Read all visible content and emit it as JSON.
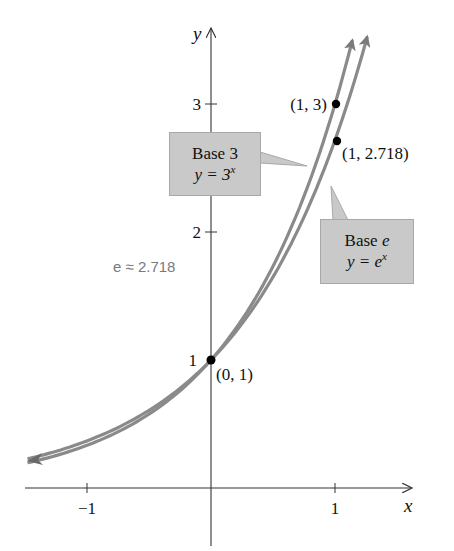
{
  "chart_data": {
    "type": "line",
    "title": "",
    "xlabel": "x",
    "ylabel": "y",
    "x_ticks": [
      -1,
      1
    ],
    "x_tick_labels": [
      "−1",
      "1"
    ],
    "y_ticks": [
      1,
      2,
      3
    ],
    "y_tick_labels": [
      "1",
      "2",
      "3"
    ],
    "xlim": [
      -1.5,
      1.6
    ],
    "ylim": [
      -0.45,
      3.6
    ],
    "grid": false,
    "series": [
      {
        "name": "Base 3",
        "equation": "y = 3^x",
        "base": 3,
        "x_range": [
          -1.48,
          1.14
        ],
        "color": "#8a8a8a",
        "sample_points": [
          [
            -1,
            0.333
          ],
          [
            0,
            1
          ],
          [
            0.5,
            1.732
          ],
          [
            1,
            3
          ]
        ]
      },
      {
        "name": "Base e",
        "equation": "y = e^x",
        "base": 2.718,
        "x_range": [
          -1.48,
          1.26
        ],
        "color": "#8a8a8a",
        "sample_points": [
          [
            -1,
            0.368
          ],
          [
            0,
            1
          ],
          [
            0.5,
            1.649
          ],
          [
            1,
            2.718
          ]
        ]
      }
    ],
    "annotations": [
      {
        "text": "(1, 3)",
        "x": 1,
        "y": 3
      },
      {
        "text": "(1, 2.718)",
        "x": 1,
        "y": 2.718
      },
      {
        "text": "(0, 1)",
        "x": 0,
        "y": 1
      },
      {
        "text": "e ≈ 2.718",
        "x": -0.8,
        "y": 1.75
      }
    ]
  },
  "axes": {
    "x_label": "x",
    "y_label": "y",
    "x_ticks": [
      {
        "label": "−1",
        "value": -1
      },
      {
        "label": "1",
        "value": 1
      }
    ],
    "y_ticks": [
      {
        "label": "1",
        "value": 1
      },
      {
        "label": "2",
        "value": 2
      },
      {
        "label": "3",
        "value": 3
      }
    ]
  },
  "points": {
    "p13": "(1, 3)",
    "p1e": "(1, 2.718)",
    "p01": "(0, 1)"
  },
  "note": "e ≈ 2.718",
  "callouts": {
    "base3": {
      "title": "Base",
      "base": "3",
      "eq_lhs": "y = 3",
      "exp": "x"
    },
    "basee": {
      "title": "Base",
      "base": "e",
      "eq_lhs": "y = e",
      "exp": "x"
    }
  },
  "colors": {
    "curve": "#8a8a8a",
    "curve_edge": "#6e6e6e",
    "box": "#c9c9c9",
    "note": "#7a7a7a",
    "axis": "#333333"
  }
}
